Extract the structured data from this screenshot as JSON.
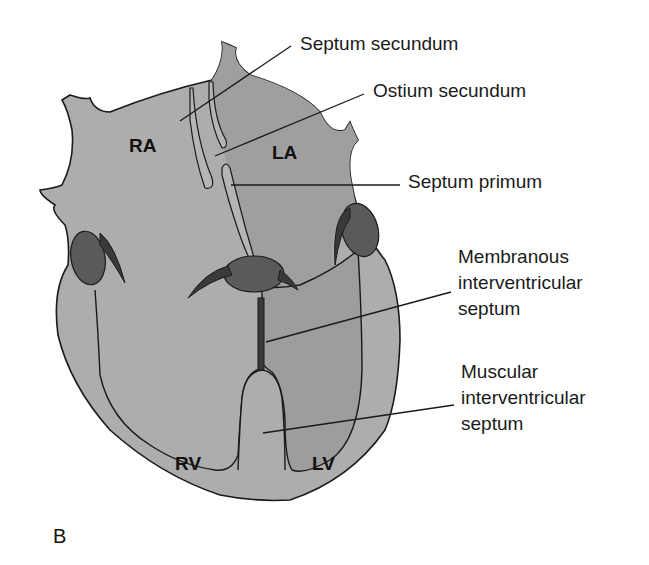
{
  "figure": {
    "panel_label": "B",
    "chambers": {
      "ra": "RA",
      "la": "LA",
      "rv": "RV",
      "lv": "LV"
    },
    "annotations": [
      {
        "id": "septum-secundum",
        "lines": [
          "Septum secundum"
        ]
      },
      {
        "id": "ostium-secundum",
        "lines": [
          "Ostium secundum"
        ]
      },
      {
        "id": "septum-primum",
        "lines": [
          "Septum primum"
        ]
      },
      {
        "id": "membranous-ivs",
        "lines": [
          "Membranous",
          "interventricular",
          "septum"
        ]
      },
      {
        "id": "muscular-ivs",
        "lines": [
          "Muscular",
          "interventricular",
          "septum"
        ]
      }
    ],
    "colors": {
      "heart_light": "#adadad",
      "heart_left": "#9d9d9d",
      "valve": "#5a5a5a",
      "outline": "#1a1a1a",
      "background": "#ffffff"
    }
  }
}
